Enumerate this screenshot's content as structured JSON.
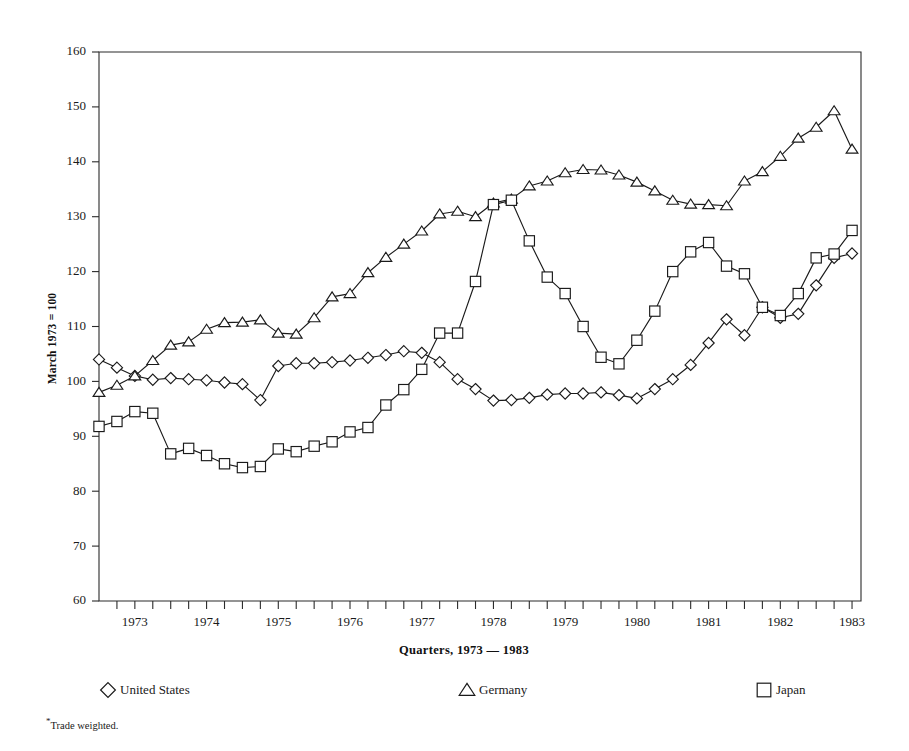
{
  "chart_data": {
    "type": "line",
    "title": "",
    "xlabel": "Quarters, 1973 — 1983",
    "ylabel": "March 1973 = 100",
    "ylim": [
      60,
      160
    ],
    "ytick_values": [
      60,
      70,
      80,
      90,
      100,
      110,
      120,
      130,
      140,
      150,
      160
    ],
    "xlim": [
      1972.75,
      1983.375
    ],
    "xtick_labels": [
      "1973",
      "1974",
      "1975",
      "1976",
      "1977",
      "1978",
      "1979",
      "1980",
      "1981",
      "1982",
      "1983"
    ],
    "xtick_years": [
      1973,
      1974,
      1975,
      1976,
      1977,
      1978,
      1979,
      1980,
      1981,
      1982,
      1983
    ],
    "grid": false,
    "legend_position": "below",
    "x": [
      1972.75,
      1973.0,
      1973.25,
      1973.5,
      1973.75,
      1974.0,
      1974.25,
      1974.5,
      1974.75,
      1975.0,
      1975.25,
      1975.5,
      1975.75,
      1976.0,
      1976.25,
      1976.5,
      1976.75,
      1977.0,
      1977.25,
      1977.5,
      1977.75,
      1978.0,
      1978.25,
      1978.5,
      1978.75,
      1979.0,
      1979.25,
      1979.5,
      1979.75,
      1980.0,
      1980.25,
      1980.5,
      1980.75,
      1981.0,
      1981.25,
      1981.5,
      1981.75,
      1982.0,
      1982.25,
      1982.5,
      1982.75,
      1983.0,
      1983.25
    ],
    "series": [
      {
        "name": "United States",
        "marker": "diamond",
        "values": [
          104.0,
          102.5,
          101.0,
          100.3,
          100.6,
          100.4,
          100.2,
          99.8,
          99.5,
          96.6,
          102.8,
          103.3,
          103.3,
          103.5,
          103.8,
          104.3,
          104.8,
          105.5,
          105.2,
          103.5,
          100.4,
          98.6,
          96.5,
          96.6,
          97.0,
          97.6,
          97.8,
          97.8,
          98.0,
          97.5,
          96.9,
          98.6,
          100.4,
          103.0,
          107.0,
          111.3,
          108.4,
          113.5,
          111.6,
          112.3,
          117.5,
          122.5,
          123.3
        ]
      },
      {
        "name": "Germany",
        "marker": "triangle",
        "values": [
          98.0,
          99.3,
          101.0,
          103.8,
          106.6,
          107.2,
          109.5,
          110.7,
          110.8,
          111.2,
          108.8,
          108.6,
          111.6,
          115.4,
          116.0,
          119.8,
          122.6,
          125.0,
          127.4,
          130.5,
          131.0,
          130.0,
          132.5,
          133.2,
          135.6,
          136.5,
          138.0,
          138.6,
          138.5,
          137.6,
          136.3,
          134.7,
          133.0,
          132.3,
          132.2,
          132.0,
          136.5,
          138.2,
          141.0,
          144.3,
          146.3,
          149.3,
          142.3
        ]
      },
      {
        "name": "Japan",
        "marker": "square",
        "values": [
          91.8,
          92.7,
          94.5,
          94.2,
          86.8,
          87.8,
          86.5,
          85.0,
          84.3,
          84.5,
          87.7,
          87.2,
          88.2,
          89.0,
          90.8,
          91.6,
          95.7,
          98.5,
          102.2,
          108.8,
          108.8,
          118.2,
          132.2,
          133.0,
          125.6,
          119.0,
          116.0,
          110.0,
          104.4,
          103.2,
          107.5,
          112.8,
          120.0,
          123.6,
          125.3,
          121.0,
          119.6,
          113.5,
          112.0,
          116.0,
          122.5,
          123.2,
          127.5
        ]
      }
    ],
    "footnote": "Trade weighted.",
    "footnote_marker": "*"
  },
  "legend": {
    "items": [
      {
        "label": "United States",
        "marker": "diamond"
      },
      {
        "label": "Germany",
        "marker": "triangle"
      },
      {
        "label": "Japan",
        "marker": "square"
      }
    ]
  },
  "colors": {
    "ink": "#1a1a1a",
    "axis": "#2b2b2b",
    "background": "#ffffff",
    "marker_fill": "#ffffff"
  }
}
